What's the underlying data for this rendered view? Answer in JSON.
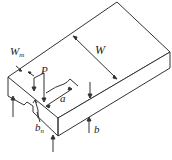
{
  "diagram": {
    "type": "specimen-schematic",
    "labels": {
      "notch_width": {
        "main": "W",
        "sub": "m"
      },
      "load": "P",
      "width": "W",
      "crack_length": "a",
      "notch_depth": {
        "main": "b",
        "sub": "n"
      },
      "thickness": "b"
    },
    "colors": {
      "line": "#333333",
      "background": "#ffffff"
    }
  }
}
